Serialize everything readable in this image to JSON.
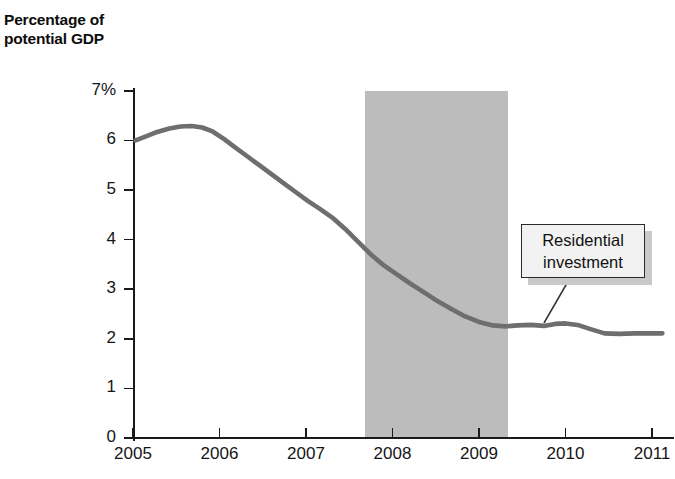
{
  "axis_title": "Percentage of\npotential GDP",
  "annotation": {
    "label": "Residential\ninvestment",
    "box": {
      "x": 521,
      "y": 224,
      "w": 124,
      "h": 54
    },
    "leader": {
      "x1": 570,
      "y1": 278,
      "x2": 544,
      "y2": 323
    }
  },
  "colors": {
    "line": "#6e6e6e",
    "recession_band": "#bcbcbc",
    "axis": "#1a1a1a",
    "callout_fill": "#f2f2f2",
    "callout_border": "#2a2a2a",
    "callout_shadow": "#c9c9c9",
    "background": "#ffffff"
  },
  "chart_data": {
    "type": "line",
    "title": "",
    "xlabel": "",
    "ylabel": "Percentage of potential GDP",
    "xlim": [
      2004.6,
      2011.2
    ],
    "ylim": [
      0,
      7
    ],
    "grid": false,
    "legend": "none",
    "y_ticks": [
      0,
      1,
      2,
      3,
      4,
      5,
      6,
      7
    ],
    "y_tick_labels": [
      "0",
      "1",
      "2",
      "3",
      "4",
      "5",
      "6",
      "7%"
    ],
    "x_ticks": [
      2005,
      2006,
      2007,
      2008,
      2009,
      2010,
      2011
    ],
    "x_tick_labels": [
      "2005",
      "2006",
      "2007",
      "2008",
      "2009",
      "2010",
      "2011"
    ],
    "shaded_regions": [
      {
        "label": "recession",
        "x_start": 2007.68,
        "x_end": 2009.33,
        "y_start": 0,
        "y_end": 7
      }
    ],
    "series": [
      {
        "name": "Residential investment",
        "color": "#6e6e6e",
        "x": [
          2005.03,
          2005.15,
          2005.28,
          2005.42,
          2005.55,
          2005.68,
          2005.8,
          2005.92,
          2006.05,
          2006.18,
          2006.32,
          2006.46,
          2006.6,
          2006.74,
          2006.88,
          2007.02,
          2007.16,
          2007.3,
          2007.45,
          2007.6,
          2007.75,
          2007.9,
          2008.05,
          2008.2,
          2008.36,
          2008.52,
          2008.68,
          2008.84,
          2009.0,
          2009.16,
          2009.3,
          2009.45,
          2009.6,
          2009.75,
          2009.88,
          2010.0,
          2010.14,
          2010.28,
          2010.45,
          2010.62,
          2010.8,
          2011.0,
          2011.12
        ],
        "y": [
          6.0,
          6.08,
          6.17,
          6.24,
          6.28,
          6.29,
          6.26,
          6.18,
          6.03,
          5.86,
          5.68,
          5.5,
          5.32,
          5.14,
          4.96,
          4.78,
          4.62,
          4.45,
          4.22,
          3.96,
          3.7,
          3.48,
          3.3,
          3.12,
          2.94,
          2.76,
          2.6,
          2.45,
          2.34,
          2.27,
          2.25,
          2.27,
          2.28,
          2.26,
          2.3,
          2.31,
          2.28,
          2.2,
          2.11,
          2.1,
          2.11,
          2.11,
          2.11
        ]
      }
    ]
  }
}
